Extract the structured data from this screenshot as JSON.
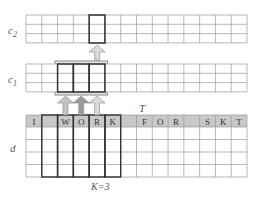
{
  "labels": {
    "c2": "c",
    "c2_sub": "2",
    "c1": "c",
    "c1_sub": "1",
    "d": "d",
    "T": "T",
    "k": "K=3"
  },
  "input_tokens": [
    "I",
    "",
    "W",
    "O",
    "R",
    "K",
    "",
    "F",
    "O",
    "R",
    "",
    "S",
    "K",
    "T"
  ],
  "grid": {
    "columns": 14,
    "c_rows": 3,
    "d_rows": 4
  },
  "colors": {
    "header": "#c8c8c8",
    "line": "#999999",
    "bold": "#333333",
    "arrow_light": "#d9d9d9",
    "arrow_dark": "#9a9a9a"
  }
}
